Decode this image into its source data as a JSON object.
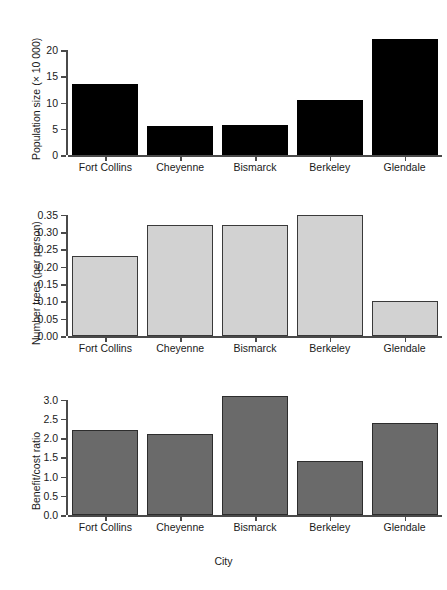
{
  "figure": {
    "width": 447,
    "height": 590,
    "background": "#ffffff",
    "panel_count": 3
  },
  "chart_data": [
    {
      "type": "bar",
      "panel": "top",
      "title": "",
      "xlabel": "",
      "ylabel": "Population size (× 10 000)",
      "categories": [
        "Fort Collins",
        "Cheyenne",
        "Bismarck",
        "Berkeley",
        "Glendale"
      ],
      "values": [
        13.5,
        5.5,
        5.8,
        10.5,
        22.2
      ],
      "ylim": [
        0,
        22.5
      ],
      "yticks": [
        0,
        5,
        10,
        15,
        20
      ],
      "ytick_labels": [
        "0",
        "5",
        "10",
        "15",
        "20"
      ],
      "bar_color": "#000000",
      "bar_edge_color": "#000000",
      "grid": false,
      "legend": false
    },
    {
      "type": "bar",
      "panel": "middle",
      "title": "",
      "xlabel": "",
      "ylabel": "Number trees (per person)",
      "categories": [
        "Fort Collins",
        "Cheyenne",
        "Bismarck",
        "Berkeley",
        "Glendale"
      ],
      "values": [
        0.23,
        0.32,
        0.32,
        0.35,
        0.1
      ],
      "ylim": [
        0.0,
        0.355
      ],
      "yticks": [
        0.0,
        0.05,
        0.1,
        0.15,
        0.2,
        0.25,
        0.3,
        0.35
      ],
      "ytick_labels": [
        "0.00",
        "0.05",
        "0.10",
        "0.15",
        "0.20",
        "0.25",
        "0.30",
        "0.35"
      ],
      "bar_color": "#d2d2d2",
      "bar_edge_color": "#3a3a3a",
      "grid": false,
      "legend": false
    },
    {
      "type": "bar",
      "panel": "bottom",
      "title": "",
      "xlabel": "City",
      "ylabel": "Benefit/cost ratio",
      "categories": [
        "Fort Collins",
        "Cheyenne",
        "Bismarck",
        "Berkeley",
        "Glendale"
      ],
      "values": [
        2.2,
        2.1,
        3.1,
        1.4,
        2.4
      ],
      "ylim": [
        0.0,
        3.12
      ],
      "yticks": [
        0.0,
        0.5,
        1.0,
        1.5,
        2.0,
        2.5,
        3.0
      ],
      "ytick_labels": [
        "0.0",
        "0.5",
        "1.0",
        "1.5",
        "2.0",
        "2.5",
        "3.0"
      ],
      "bar_color": "#6a6a6a",
      "bar_edge_color": "#2d2d2d",
      "grid": false,
      "legend": false
    }
  ]
}
